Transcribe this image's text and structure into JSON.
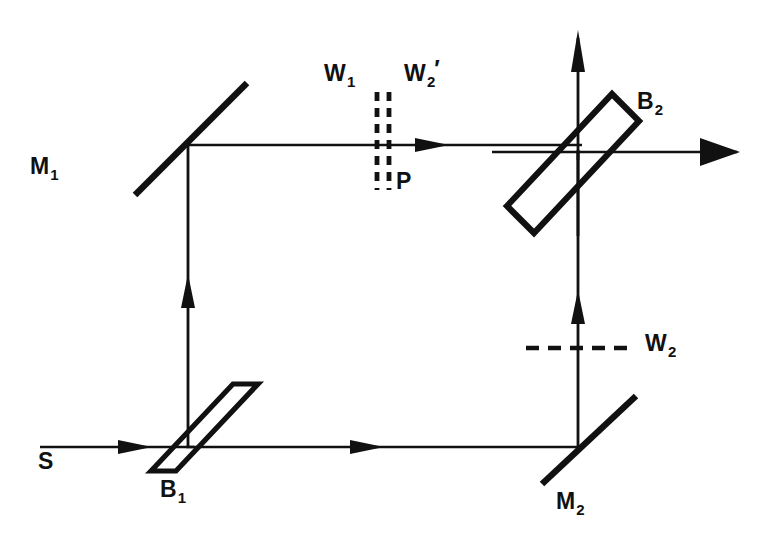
{
  "figure": {
    "background_color": "#ffffff",
    "ink_color": "#111111",
    "width": 776,
    "height": 547
  },
  "labels": {
    "source": {
      "base": "S",
      "sub": "",
      "prime": "",
      "x": 38,
      "y": 450
    },
    "mirror1": {
      "base": "M",
      "sub": "1",
      "prime": "",
      "x": 30,
      "y": 155
    },
    "mirror2": {
      "base": "M",
      "sub": "2",
      "prime": "",
      "x": 556,
      "y": 490
    },
    "splitter1": {
      "base": "B",
      "sub": "1",
      "prime": "",
      "x": 160,
      "y": 478
    },
    "splitter2": {
      "base": "B",
      "sub": "2",
      "prime": "",
      "x": 637,
      "y": 90
    },
    "wave1": {
      "base": "W",
      "sub": "1",
      "prime": "",
      "x": 324,
      "y": 62
    },
    "wave2prime": {
      "base": "W",
      "sub": "2",
      "prime": "′",
      "x": 404,
      "y": 62
    },
    "wave2": {
      "base": "W",
      "sub": "2",
      "prime": "",
      "x": 645,
      "y": 332
    },
    "plane": {
      "base": "P",
      "sub": "",
      "prime": "",
      "x": 396,
      "y": 170
    }
  },
  "components": {
    "mirror1": {
      "name": "M1 mirror",
      "x1": 136,
      "y1": 194,
      "x2": 246,
      "y2": 84,
      "stroke_width": 6
    },
    "mirror2": {
      "name": "M2 mirror",
      "x1": 543,
      "y1": 483,
      "x2": 635,
      "y2": 397,
      "stroke_width": 6
    },
    "splitter1": {
      "name": "B1 beam splitter",
      "points": "152,470 232,385 257,385 177,470",
      "stroke_width": 5
    },
    "splitter2": {
      "name": "B2 beam splitter",
      "points": "508,205 613,95 638,122 533,232",
      "stroke_width": 6
    }
  },
  "beams": {
    "input": {
      "name": "source beam into B1",
      "x1": 40,
      "y1": 447,
      "x2": 192,
      "y2": 447,
      "arrow_at": 0.62
    },
    "left_vertical": {
      "name": "upper-left arm B1 to M1",
      "x1": 188,
      "y1": 445,
      "x2": 188,
      "y2": 147,
      "arrow_at": 0.54
    },
    "top_horizontal": {
      "name": "upper arm M1 to B2",
      "x1": 187,
      "y1": 145,
      "x2": 580,
      "y2": 145,
      "arrow_at": 0.67
    },
    "bottom_horizontal": {
      "name": "lower arm B1 to M2",
      "x1": 186,
      "y1": 447,
      "x2": 582,
      "y2": 447,
      "arrow_at": 0.49
    },
    "right_vertical": {
      "name": "lower arm M2 to B2",
      "x1": 578,
      "y1": 449,
      "x2": 578,
      "y2": 150,
      "arrow_at": 0.52
    },
    "output_up": {
      "name": "B2 vertical output",
      "x1": 578,
      "y1": 150,
      "x2": 578,
      "y2": 32,
      "arrow_at": 1.0
    },
    "output_right": {
      "name": "B2 horizontal output",
      "x1": 578,
      "y1": 152,
      "x2": 740,
      "y2": 152,
      "arrow_at": 1.0
    },
    "b2_down_stub": {
      "name": "B2 lower vertical stub",
      "x1": 578,
      "y1": 152,
      "x2": 578,
      "y2": 232
    },
    "b2_left_stub": {
      "name": "B2 left horizontal stub",
      "x1": 494,
      "y1": 152,
      "x2": 580,
      "y2": 152
    },
    "b2_right_stub": {
      "name": "B2 right stub to output",
      "x1": 578,
      "y1": 152,
      "x2": 690,
      "y2": 152
    }
  },
  "dashed": {
    "w1": {
      "name": "W1 wavefront plane",
      "x": 377,
      "y_top": 92,
      "y_bottom": 190,
      "dash": "9 7",
      "stroke_width": 4.5
    },
    "w2p": {
      "name": "W2-prime wavefront plane",
      "x": 388,
      "y_top": 92,
      "y_bottom": 190,
      "dash": "9 7",
      "stroke_width": 4.5
    },
    "w2": {
      "name": "W2 wavefront plane",
      "x_left": 526,
      "x_right": 632,
      "y": 348,
      "dash": "12 9",
      "stroke_width": 4.5
    }
  },
  "arrows": {
    "input_tip": {
      "x": 152,
      "y": 447,
      "dir": "right"
    },
    "top_tip": {
      "x": 447,
      "y": 145,
      "dir": "right"
    },
    "bottom_tip": {
      "x": 382,
      "y": 447,
      "dir": "right"
    },
    "left_vertical_tip": {
      "x": 188,
      "y": 276,
      "dir": "up"
    },
    "right_vertical_tip": {
      "x": 578,
      "y": 292,
      "dir": "up"
    },
    "output_up_tip": {
      "x": 578,
      "y": 32,
      "dir": "up"
    },
    "output_right_tip": {
      "x": 740,
      "y": 152,
      "dir": "right"
    }
  }
}
